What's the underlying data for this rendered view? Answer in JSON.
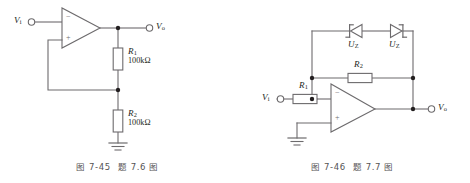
{
  "figures": [
    {
      "id": "fig-7-45",
      "caption": {
        "prefix": "图 7-45",
        "suffix": "题 7.6 图"
      },
      "circuit_type": "non-inverting-amplifier",
      "terminals": [
        {
          "name": "input",
          "label": "V",
          "sub": "i"
        },
        {
          "name": "output",
          "label": "V",
          "sub": "o"
        }
      ],
      "opamp": {
        "inverting": "−",
        "noninverting": "+"
      },
      "components": [
        {
          "ref": "R",
          "sub": "1",
          "value": "100kΩ",
          "orientation": "vertical"
        },
        {
          "ref": "R",
          "sub": "2",
          "value": "100kΩ",
          "orientation": "vertical"
        }
      ],
      "ground": true
    },
    {
      "id": "fig-7-46",
      "caption": {
        "prefix": "图 7-46",
        "suffix": "题 7.7 图"
      },
      "circuit_type": "inverting-amplifier-with-zener-limiter",
      "terminals": [
        {
          "name": "input",
          "label": "V",
          "sub": "i"
        },
        {
          "name": "output",
          "label": "V",
          "sub": "o"
        }
      ],
      "opamp": {
        "inverting": "−",
        "noninverting": "+"
      },
      "components": [
        {
          "ref": "R",
          "sub": "1",
          "value": "",
          "orientation": "horizontal"
        },
        {
          "ref": "R",
          "sub": "2",
          "value": "",
          "orientation": "horizontal"
        },
        {
          "ref": "U",
          "sub": "Z",
          "value": "",
          "orientation": "zener-left"
        },
        {
          "ref": "U",
          "sub": "Z",
          "value": "",
          "orientation": "zener-right"
        }
      ],
      "ground": true
    }
  ],
  "colors": {
    "wire": "#6d6b6d",
    "ink": "#231f20",
    "caption": "#555355",
    "node": "#231f20",
    "component_stroke": "#6d6b6d",
    "component_fill": "#ffffff"
  }
}
